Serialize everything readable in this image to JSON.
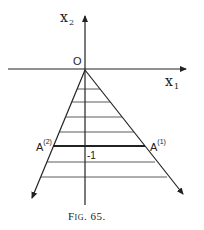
{
  "figure": {
    "caption": "Fig. 65.",
    "labels": {
      "x1_axis": {
        "base": "x",
        "sub": "1"
      },
      "x2_axis": {
        "base": "x",
        "sub": "2"
      },
      "origin": "O",
      "A1": {
        "base": "A",
        "sup": "(1)"
      },
      "A2": {
        "base": "A",
        "sup": "(2)"
      },
      "minus_one": "-1"
    },
    "colors": {
      "ink": "#222222",
      "background": "#ffffff"
    }
  }
}
